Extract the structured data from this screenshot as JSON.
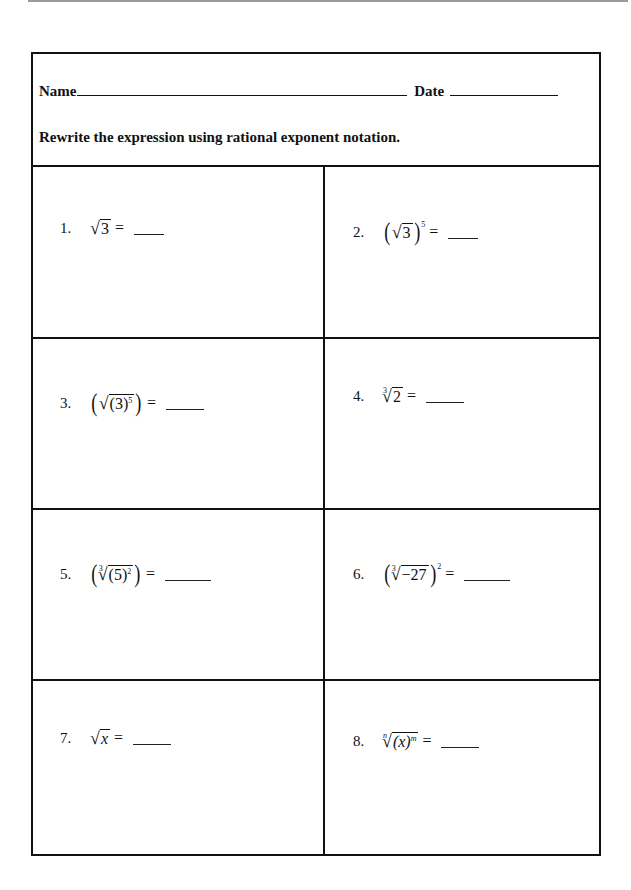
{
  "worksheet": {
    "header": {
      "name_label": "Name",
      "date_label": "Date",
      "instructions": "Rewrite the expression using rational exponent notation."
    },
    "problems": [
      {
        "number": "1.",
        "expression": "√3 =",
        "radicand": "3",
        "index": "",
        "outer_exponent": "",
        "inner_exponent": "",
        "answer": ""
      },
      {
        "number": "2.",
        "expression": "(√3)^5 =",
        "radicand": "3",
        "index": "",
        "outer_exponent": "5",
        "inner_exponent": "",
        "answer": ""
      },
      {
        "number": "3.",
        "expression": "(√(3)^5) =",
        "radicand": "(3)",
        "index": "",
        "outer_exponent": "",
        "inner_exponent": "5",
        "answer": ""
      },
      {
        "number": "4.",
        "expression": "∛2 =",
        "radicand": "2",
        "index": "3",
        "outer_exponent": "",
        "inner_exponent": "",
        "answer": ""
      },
      {
        "number": "5.",
        "expression": "(∛(5)^2) =",
        "radicand": "(5)",
        "index": "3",
        "outer_exponent": "",
        "inner_exponent": "2",
        "answer": ""
      },
      {
        "number": "6.",
        "expression": "(∛−27)^2 =",
        "radicand": "−27",
        "index": "3",
        "outer_exponent": "2",
        "inner_exponent": "",
        "answer": ""
      },
      {
        "number": "7.",
        "expression": "√x =",
        "radicand": "x",
        "index": "",
        "outer_exponent": "",
        "inner_exponent": "",
        "answer": ""
      },
      {
        "number": "8.",
        "expression": "ⁿ√(x)^m =",
        "radicand": "(x)",
        "index": "n",
        "outer_exponent": "",
        "inner_exponent": "m",
        "answer": ""
      }
    ],
    "symbols": {
      "sqrt": "√",
      "equals": "=",
      "open_paren": "(",
      "close_paren": ")"
    }
  }
}
